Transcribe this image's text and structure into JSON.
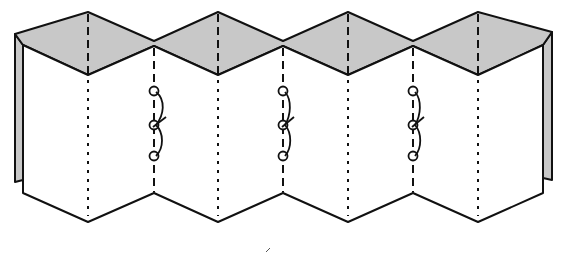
{
  "diagram": {
    "colors": {
      "background": "#ffffff",
      "top_edge_fill": "#c8c8c8",
      "page_fill": "#ffffff",
      "stroke": "#111111"
    },
    "folds_x": [
      88,
      154,
      218,
      283,
      348,
      413,
      478
    ],
    "peak_folds_x": [
      88,
      218,
      348,
      478
    ],
    "stitched_folds_x": [
      154,
      283,
      413
    ],
    "stitch_holes_y": [
      91,
      125,
      156
    ],
    "panel_count": 7
  }
}
